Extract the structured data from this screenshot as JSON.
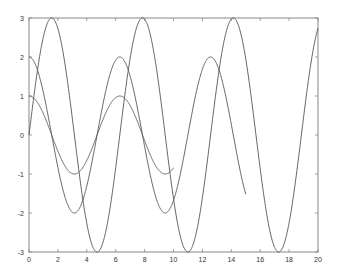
{
  "chart_data": {
    "type": "line",
    "title": "",
    "xlabel": "",
    "ylabel": "",
    "xlim": [
      0,
      20
    ],
    "ylim": [
      -3,
      3
    ],
    "grid": false,
    "legend": null,
    "x_ticks": [
      0,
      2,
      4,
      6,
      8,
      10,
      12,
      14,
      16,
      18,
      20
    ],
    "y_ticks": [
      -3,
      -2,
      -1,
      0,
      1,
      2,
      3
    ],
    "series": [
      {
        "name": "cos(x)",
        "function": "1*cos(x)",
        "amp": 1,
        "fn": "cos",
        "x_range": [
          0,
          10
        ],
        "color": "#555555",
        "x": [
          0,
          1,
          2,
          3,
          4,
          5,
          6,
          7,
          8,
          9,
          10
        ],
        "values": [
          1.0,
          0.54,
          -0.42,
          -0.99,
          -0.65,
          0.28,
          0.96,
          0.75,
          -0.15,
          -0.91,
          -0.84
        ]
      },
      {
        "name": "2cos(x)",
        "function": "2*cos(x)",
        "amp": 2,
        "fn": "cos",
        "x_range": [
          0,
          15
        ],
        "color": "#555555",
        "x": [
          0,
          1,
          2,
          3,
          4,
          5,
          6,
          7,
          8,
          9,
          10,
          11,
          12,
          13,
          14,
          15
        ],
        "values": [
          2.0,
          1.08,
          -0.83,
          -1.98,
          -1.31,
          0.57,
          1.92,
          1.51,
          -0.29,
          -1.82,
          -1.68,
          0.01,
          1.69,
          1.81,
          0.27,
          -1.52
        ]
      },
      {
        "name": "3sin(x)",
        "function": "3*sin(x)",
        "amp": 3,
        "fn": "sin",
        "x_range": [
          0,
          20
        ],
        "color": "#555555",
        "x": [
          0,
          2,
          4,
          6,
          8,
          10,
          12,
          14,
          16,
          18,
          20
        ],
        "values": [
          0.0,
          2.73,
          -2.27,
          -0.84,
          2.97,
          -1.63,
          -1.61,
          2.97,
          -0.86,
          -2.25,
          2.74
        ]
      }
    ]
  }
}
